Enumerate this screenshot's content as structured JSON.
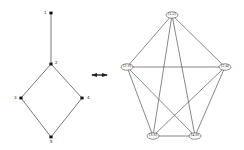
{
  "diagram": {
    "left_graph": {
      "name": "hasse-diagram",
      "nodes": [
        {
          "id": "1",
          "label": "1",
          "x": 51,
          "y": 13,
          "label_dx": -7,
          "label_dy": -2
        },
        {
          "id": "2",
          "label": "2",
          "x": 51,
          "y": 64,
          "label_dx": 4,
          "label_dy": -3
        },
        {
          "id": "3",
          "label": "3",
          "x": 21,
          "y": 98,
          "label_dx": -7,
          "label_dy": -2
        },
        {
          "id": "4",
          "label": "4",
          "x": 82,
          "y": 98,
          "label_dx": 5,
          "label_dy": -2
        },
        {
          "id": "5",
          "label": "5",
          "x": 51,
          "y": 137,
          "label_dx": -1,
          "label_dy": 3
        }
      ],
      "edges": [
        [
          "1",
          "2"
        ],
        [
          "2",
          "3"
        ],
        [
          "2",
          "4"
        ],
        [
          "3",
          "5"
        ],
        [
          "4",
          "5"
        ]
      ]
    },
    "arrow": {
      "type": "double-headed",
      "x1": 88,
      "y1": 75,
      "x2": 111,
      "y2": 75
    },
    "right_graph": {
      "name": "complete-graph-k5",
      "nodes": [
        {
          "id": "12",
          "label": "(1,2)",
          "x": 172,
          "y": 15
        },
        {
          "id": "23",
          "label": "(2,3)",
          "x": 127,
          "y": 67
        },
        {
          "id": "24",
          "label": "(2,4)",
          "x": 225,
          "y": 67
        },
        {
          "id": "35",
          "label": "(3,5)",
          "x": 153,
          "y": 136
        },
        {
          "id": "45",
          "label": "(4,5)",
          "x": 195,
          "y": 136
        }
      ],
      "edges": [
        [
          "12",
          "23"
        ],
        [
          "12",
          "24"
        ],
        [
          "12",
          "35"
        ],
        [
          "12",
          "45"
        ],
        [
          "23",
          "24"
        ],
        [
          "23",
          "35"
        ],
        [
          "23",
          "45"
        ],
        [
          "24",
          "35"
        ],
        [
          "24",
          "45"
        ],
        [
          "35",
          "45"
        ]
      ]
    },
    "colors": {
      "line": "#555555",
      "node": "#111111",
      "oval_fill": "#ffffff",
      "oval_stroke": "#444444"
    }
  }
}
